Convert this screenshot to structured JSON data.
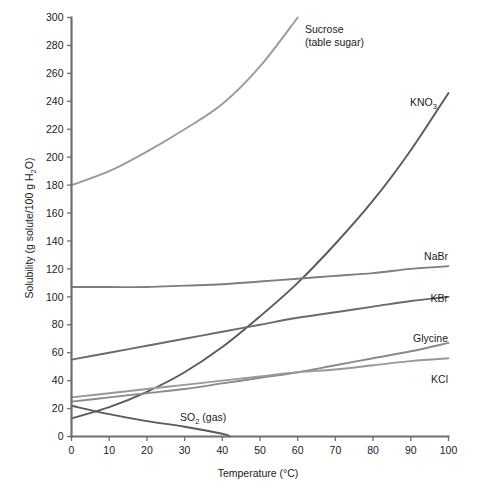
{
  "chart_data": {
    "type": "line",
    "title": "",
    "xlabel": "Temperature (°C)",
    "ylabel": "Solubility (g solute/100 g H₂O)",
    "xlim": [
      0,
      100
    ],
    "ylim": [
      0,
      300
    ],
    "xticks": [
      0,
      10,
      20,
      30,
      40,
      50,
      60,
      70,
      80,
      90,
      100
    ],
    "yticks": [
      0,
      20,
      40,
      60,
      80,
      100,
      120,
      140,
      160,
      180,
      200,
      220,
      240,
      260,
      280,
      300
    ],
    "grid": false,
    "legend": "inline-labels-at-curve-ends",
    "series": [
      {
        "name": "Sucrose (table sugar)",
        "label_line1": "Sucrose",
        "label_line2": "(table sugar)",
        "color": "#9a9a9a",
        "x": [
          0,
          10,
          20,
          30,
          40,
          50,
          60
        ],
        "values": [
          180,
          190,
          204,
          220,
          238,
          265,
          300
        ]
      },
      {
        "name": "KNO3",
        "label_main": "KNO",
        "label_sub": "3",
        "color": "#5a5a5a",
        "x": [
          0,
          10,
          20,
          30,
          40,
          50,
          60,
          70,
          80,
          90,
          100
        ],
        "values": [
          13,
          21,
          32,
          46,
          64,
          86,
          110,
          138,
          169,
          205,
          246
        ]
      },
      {
        "name": "NaBr",
        "label_main": "NaBr",
        "color": "#7d7d7d",
        "x": [
          0,
          10,
          20,
          30,
          40,
          50,
          60,
          70,
          80,
          90,
          100
        ],
        "values": [
          107,
          107,
          107,
          108,
          109,
          111,
          113,
          115,
          117,
          120,
          122
        ]
      },
      {
        "name": "KBr",
        "label_main": "KBr",
        "color": "#6a6a6a",
        "x": [
          0,
          10,
          20,
          30,
          40,
          50,
          60,
          70,
          80,
          90,
          100
        ],
        "values": [
          55,
          60,
          65,
          70,
          75,
          80,
          85,
          89,
          93,
          97,
          100
        ]
      },
      {
        "name": "Glycine",
        "label_main": "Glycine",
        "color": "#8a8a8a",
        "x": [
          0,
          10,
          20,
          30,
          40,
          50,
          60,
          70,
          80,
          90,
          100
        ],
        "values": [
          25,
          28,
          31,
          34,
          38,
          42,
          46,
          51,
          56,
          61,
          67
        ]
      },
      {
        "name": "KCl",
        "label_main": "KCl",
        "color": "#989898",
        "x": [
          0,
          10,
          20,
          30,
          40,
          50,
          60,
          70,
          80,
          90,
          100
        ],
        "values": [
          28,
          31,
          34,
          37,
          40,
          43,
          46,
          48,
          51,
          54,
          56
        ]
      },
      {
        "name": "SO2 (gas)",
        "label_main": "SO",
        "label_sub": "2",
        "label_tail": " (gas)",
        "color": "#5a5a5a",
        "x": [
          0,
          10,
          20,
          30,
          40,
          42
        ],
        "values": [
          22,
          16,
          11,
          7,
          2,
          0
        ]
      }
    ],
    "axis_color": "#6e6e6e",
    "text_color": "#1a1a1a",
    "background": "#ffffff"
  }
}
